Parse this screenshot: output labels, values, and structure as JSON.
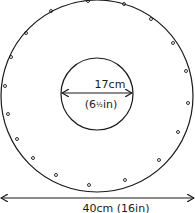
{
  "diagram": {
    "outer_circle": {
      "cx": 97,
      "cy": 96,
      "r": 96,
      "label": "40cm (16in)"
    },
    "inner_circle": {
      "cx": 97,
      "cy": 94,
      "r": 36,
      "label_top": "17cm",
      "label_bottom_prefix": "(6",
      "label_fraction": "½",
      "label_bottom_suffix": "in)"
    },
    "dots_ring_radius": 83,
    "dot_count": 18,
    "line_color": "#1a1a1a"
  },
  "dots": [
    {
      "x": 88,
      "y": 1
    },
    {
      "x": 124,
      "y": 4
    },
    {
      "x": 151,
      "y": 19
    },
    {
      "x": 173,
      "y": 43
    },
    {
      "x": 186,
      "y": 71
    },
    {
      "x": 188,
      "y": 103
    },
    {
      "x": 178,
      "y": 132
    },
    {
      "x": 159,
      "y": 160
    },
    {
      "x": 125,
      "y": 180
    },
    {
      "x": 89,
      "y": 185
    },
    {
      "x": 56,
      "y": 175
    },
    {
      "x": 33,
      "y": 158
    },
    {
      "x": 17,
      "y": 139
    },
    {
      "x": 8,
      "y": 114
    },
    {
      "x": 5,
      "y": 86
    },
    {
      "x": 11,
      "y": 57
    },
    {
      "x": 26,
      "y": 33
    },
    {
      "x": 51,
      "y": 11
    }
  ]
}
